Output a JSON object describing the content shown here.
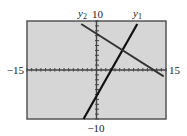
{
  "chart_data": {
    "type": "line",
    "title": "",
    "xlabel": "",
    "ylabel": "",
    "xlim": [
      -15,
      15
    ],
    "ylim": [
      -10,
      10
    ],
    "x_tick_step": 1,
    "y_tick_step": 1,
    "grid": false,
    "legend": "inline labels above lines",
    "axis_labels": {
      "xmin": "−15",
      "xmax": "15",
      "ymax": "10",
      "ymin": "−10"
    },
    "series": [
      {
        "name": "y1",
        "label": "y",
        "sub": "1",
        "x": [
          -2.8,
          8.8
        ],
        "y": [
          -10,
          9.4
        ],
        "color": "#111111",
        "width": 2.2
      },
      {
        "name": "y2",
        "label": "y",
        "sub": "2",
        "x": [
          -3.3,
          14.5
        ],
        "y": [
          9.4,
          -1.3
        ],
        "color": "#333333",
        "width": 1.8
      }
    ]
  },
  "colors": {
    "plot_bg": "#d6d6d6",
    "frame": "#555555",
    "axis": "#444444"
  }
}
